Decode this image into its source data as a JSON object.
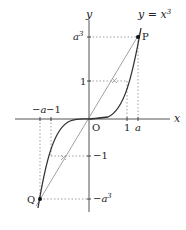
{
  "figure": {
    "curve_label": "y = x",
    "curve_label_exp": "3",
    "axes": {
      "x_label": "x",
      "y_label": "y",
      "origin_label": "O"
    },
    "x_ticks": [
      {
        "id": "neg-a",
        "label": "−a"
      },
      {
        "id": "neg-1",
        "label": "−1"
      },
      {
        "id": "one",
        "label": "1"
      },
      {
        "id": "a",
        "label": "a"
      }
    ],
    "y_ticks": [
      {
        "id": "a3",
        "label": "a",
        "exp": "3"
      },
      {
        "id": "one",
        "label": "1"
      },
      {
        "id": "neg-1",
        "label": "−1"
      },
      {
        "id": "neg-a3",
        "label": "−a",
        "exp": "3"
      }
    ],
    "points": [
      {
        "id": "P",
        "label": "P"
      },
      {
        "id": "Q",
        "label": "Q"
      }
    ],
    "colors": {
      "axis": "#555555",
      "curve": "#333333",
      "secant": "#777777",
      "dotted": "#888888"
    }
  }
}
